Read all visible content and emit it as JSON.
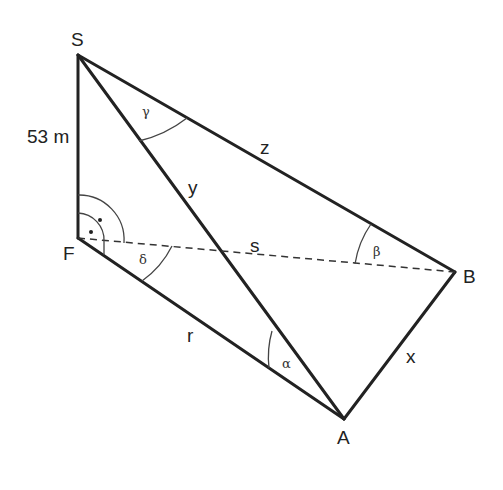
{
  "diagram": {
    "points": {
      "S": "S",
      "F": "F",
      "B": "B",
      "A": "A"
    },
    "measures": {
      "height": "53 m"
    },
    "sides": {
      "y": "y",
      "z": "z",
      "s": "s",
      "r": "r",
      "x": "x"
    },
    "angles": {
      "alpha": "α",
      "beta": "β",
      "gamma": "γ",
      "delta": "δ"
    },
    "right_angle_marks": 2
  }
}
